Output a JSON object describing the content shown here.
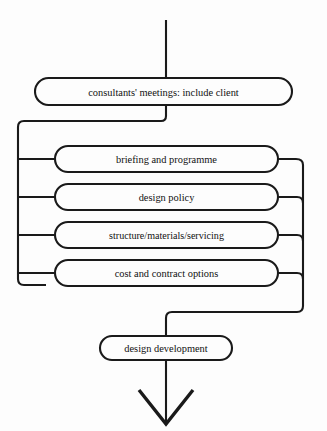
{
  "diagram": {
    "background_color": "#fdfdfd",
    "line_color": "#1a1a1a",
    "text_color": "#111111",
    "entry": {
      "name": "entry-flow-line",
      "description": "vertical line entering from top"
    },
    "nodes": [
      {
        "id": "consultants-meetings",
        "label": "consultants' meetings: include client",
        "shape": "rounded-rectangle",
        "x": 35,
        "y": 78,
        "width": 257,
        "height": 27
      },
      {
        "id": "briefing-and-programme",
        "label": "briefing and programme",
        "shape": "rounded-rectangle",
        "x": 55,
        "y": 146,
        "width": 223,
        "height": 26
      },
      {
        "id": "design-policy",
        "label": "design policy",
        "shape": "rounded-rectangle",
        "x": 55,
        "y": 184,
        "width": 223,
        "height": 26
      },
      {
        "id": "structure-materials-servicing",
        "label": "structure/materials/servicing",
        "shape": "rounded-rectangle",
        "x": 55,
        "y": 222,
        "width": 223,
        "height": 26
      },
      {
        "id": "cost-and-contract-options",
        "label": "cost and contract options",
        "shape": "rounded-rectangle",
        "x": 55,
        "y": 260,
        "width": 223,
        "height": 26
      },
      {
        "id": "design-development",
        "label": "design development",
        "shape": "rounded-rectangle",
        "x": 100,
        "y": 336,
        "width": 132,
        "height": 24
      }
    ],
    "exit": {
      "name": "exit-flow-arrow",
      "description": "vertical line ending in open chevron arrowhead pointing down"
    }
  }
}
